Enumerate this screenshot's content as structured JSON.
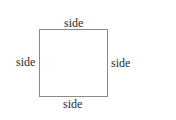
{
  "diagram": {
    "shape": "square",
    "stroke_color": "#8a8a8a",
    "labels": {
      "top": "side",
      "left": "side",
      "right": "side",
      "bottom": "side"
    }
  }
}
